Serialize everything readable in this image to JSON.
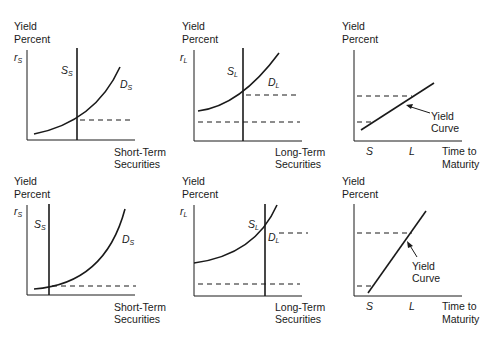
{
  "panels": {
    "top": {
      "short": {
        "ylabel_1": "Yield",
        "ylabel_2": "Percent",
        "axis_var": "r",
        "axis_sub": "S",
        "supply": "S",
        "supply_sub": "S",
        "demand": "D",
        "demand_sub": "S",
        "xlabel_1": "Short-Term",
        "xlabel_2": "Securities"
      },
      "long": {
        "ylabel_1": "Yield",
        "ylabel_2": "Percent",
        "axis_var": "r",
        "axis_sub": "L",
        "supply": "S",
        "supply_sub": "L",
        "demand": "D",
        "demand_sub": "L",
        "xlabel_1": "Long-Term",
        "xlabel_2": "Securities"
      },
      "curve": {
        "ylabel_1": "Yield",
        "ylabel_2": "Percent",
        "tick_s": "S",
        "tick_l": "L",
        "annot_1": "Yield",
        "annot_2": "Curve",
        "xlabel_1": "Time to",
        "xlabel_2": "Maturity"
      }
    },
    "bottom": {
      "short": {
        "ylabel_1": "Yield",
        "ylabel_2": "Percent",
        "axis_var": "r",
        "axis_sub": "S",
        "supply": "S",
        "supply_sub": "S",
        "demand": "D",
        "demand_sub": "S",
        "xlabel_1": "Short-Term",
        "xlabel_2": "Securities"
      },
      "long": {
        "ylabel_1": "Yield",
        "ylabel_2": "Percent",
        "axis_var": "r",
        "axis_sub": "L",
        "supply": "S",
        "supply_sub": "L",
        "demand": "D",
        "demand_sub": "L",
        "xlabel_1": "Long-Term",
        "xlabel_2": "Securities"
      },
      "curve": {
        "ylabel_1": "Yield",
        "ylabel_2": "Percent",
        "tick_s": "S",
        "tick_l": "L",
        "annot_1": "Yield",
        "annot_2": "Curve",
        "xlabel_1": "Time to",
        "xlabel_2": "Maturity"
      }
    }
  }
}
